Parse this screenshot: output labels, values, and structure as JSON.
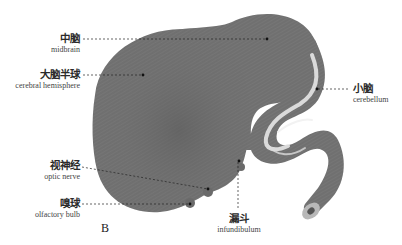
{
  "figure": {
    "panel_label": "B",
    "colors": {
      "tissue": "#6f6f6f",
      "tissue_dark": "#5c5c5c",
      "highlight": "#e8e8e8",
      "leader": "#222222",
      "text": "#2a2a2a"
    },
    "labels": [
      {
        "id": "midbrain",
        "zh": "中脑",
        "en": "midbrain"
      },
      {
        "id": "cerebral-hemisphere",
        "zh": "大脑半球",
        "en": "cerebral hemisphere"
      },
      {
        "id": "cerebellum",
        "zh": "小脑",
        "en": "cerebellum"
      },
      {
        "id": "optic-nerve",
        "zh": "视神经",
        "en": "optic nerve"
      },
      {
        "id": "olfactory-bulb",
        "zh": "嗅球",
        "en": "olfactory bulb"
      },
      {
        "id": "infundibulum",
        "zh": "漏斗",
        "en": "infundibulum"
      }
    ]
  }
}
